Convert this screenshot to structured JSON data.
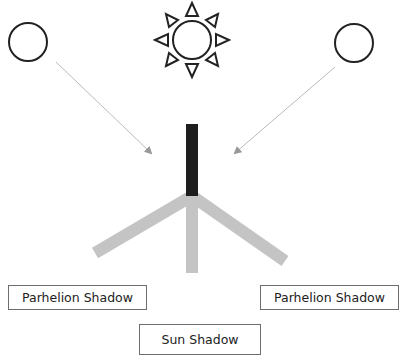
{
  "labels": {
    "left_shadow": "Parhelion Shadow",
    "right_shadow": "Parhelion Shadow",
    "sun_shadow": "Sun Shadow"
  },
  "elements": {
    "sun": {
      "icon": "sun-icon",
      "center": [
        192,
        40
      ],
      "radius": 19
    },
    "left_parhelion": {
      "icon": "circle-icon",
      "center": [
        28,
        42
      ],
      "radius": 19
    },
    "right_parhelion": {
      "icon": "circle-icon",
      "center": [
        354,
        43
      ],
      "radius": 19
    }
  },
  "colors": {
    "stroke": "#222222",
    "pole": "#1e1e1e",
    "shadow": "#c4c4c4",
    "arrow": "#b8b8b8",
    "arrowhead": "#999999"
  }
}
